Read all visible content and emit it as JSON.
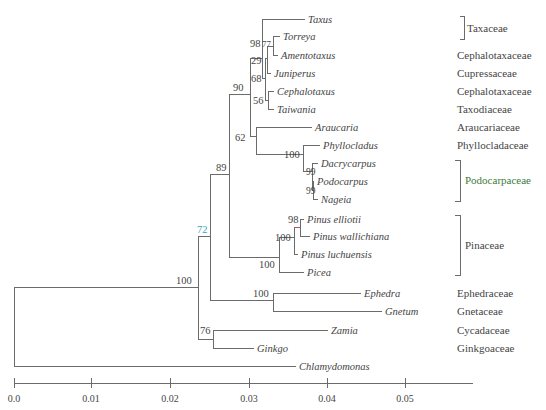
{
  "figure": {
    "type": "phylogenetic_tree",
    "colors": {
      "branch": "#6b6b6b",
      "highlight_branch": "#c0506a",
      "bootstrap_highlight": "#3aa6b8",
      "family_highlight": "#3c7a3c",
      "text": "#444444"
    }
  },
  "taxa": [
    {
      "id": "taxus",
      "label": "Taxus"
    },
    {
      "id": "torreya",
      "label": "Torreya"
    },
    {
      "id": "amentotaxus",
      "label": "Amentotaxus"
    },
    {
      "id": "juniperus",
      "label": "Juniperus"
    },
    {
      "id": "cephalotaxus",
      "label": "Cephalotaxus"
    },
    {
      "id": "taiwania",
      "label": "Taiwania"
    },
    {
      "id": "araucaria",
      "label": "Araucaria"
    },
    {
      "id": "phyllocladus",
      "label": "Phyllocladus"
    },
    {
      "id": "dacrycarpus",
      "label": "Dacrycarpus"
    },
    {
      "id": "podocarpus",
      "label": "Podocarpus"
    },
    {
      "id": "nageia",
      "label": "Nageia"
    },
    {
      "id": "pinus_elliotii",
      "label": "Pinus elliotii"
    },
    {
      "id": "pinus_wallichiana",
      "label": "Pinus wallichiana"
    },
    {
      "id": "pinus_luchuensis",
      "label": "Pinus luchuensis"
    },
    {
      "id": "picea",
      "label": "Picea"
    },
    {
      "id": "ephedra",
      "label": "Ephedra"
    },
    {
      "id": "gnetum",
      "label": "Gnetum"
    },
    {
      "id": "zamia",
      "label": "Zamia"
    },
    {
      "id": "ginkgo",
      "label": "Ginkgo"
    },
    {
      "id": "chlamydomonas",
      "label": "Chlamydomonas"
    }
  ],
  "bootstrap": {
    "root": "100",
    "seed_plants": "72",
    "conifers": "89",
    "taxaceae_group": "90",
    "taxus_group": "98",
    "torreya_amentotaxus": "77",
    "juniperus_node": "29",
    "cupressales": "68",
    "ceph_taiwania": "56",
    "araucaria_group": "62",
    "podocarp_group": "100",
    "dacrycarpus_node": "99",
    "podocarpus_nageia": "99",
    "pinaceae": "100",
    "pinus": "100",
    "pinus_ell_wal": "98",
    "gnetales": "100",
    "cycad_ginkgo": "76"
  },
  "families": [
    {
      "label": "Taxaceae",
      "bracket": true
    },
    {
      "label": "Cephalotaxaceae",
      "bracket": false
    },
    {
      "label": "Cupressaceae",
      "bracket": false
    },
    {
      "label": "Cephalotaxaceae",
      "bracket": false
    },
    {
      "label": "Taxodiaceae",
      "bracket": false
    },
    {
      "label": "Araucariaceae",
      "bracket": false
    },
    {
      "label": "Phyllocladaceae",
      "bracket": false
    },
    {
      "label": "Podocarpaceae",
      "bracket": true
    },
    {
      "label": "Pinaceae",
      "bracket": true
    },
    {
      "label": "Ephedraceae",
      "bracket": false
    },
    {
      "label": "Gnetaceae",
      "bracket": false
    },
    {
      "label": "Cycadaceae",
      "bracket": false
    },
    {
      "label": "Ginkgoaceae",
      "bracket": false
    }
  ],
  "axis": {
    "ticks": [
      "0.0",
      "0.01",
      "0.02",
      "0.03",
      "0.04",
      "0.05"
    ],
    "range": [
      0.0,
      0.058
    ]
  }
}
